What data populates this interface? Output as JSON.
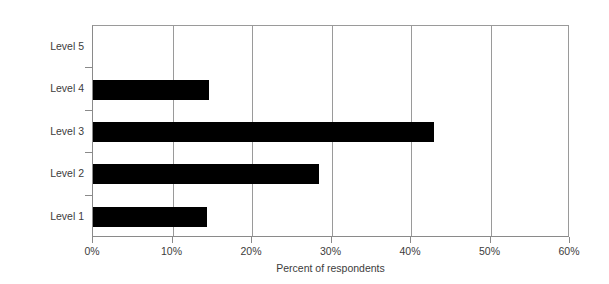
{
  "chart_data": {
    "type": "bar",
    "orientation": "horizontal",
    "title": "",
    "xlabel": "Percent of respondents",
    "ylabel": "",
    "categories": [
      "Level 1",
      "Level 2",
      "Level 3",
      "Level 4",
      "Level 5"
    ],
    "values": [
      14.4,
      28.6,
      43.1,
      14.6,
      0
    ],
    "xlim": [
      0,
      60
    ],
    "ylim": null,
    "xticks": [
      0,
      10,
      20,
      30,
      40,
      50,
      60
    ],
    "xtick_labels": [
      "0%",
      "10%",
      "20%",
      "30%",
      "40%",
      "50%",
      "60%"
    ],
    "grid": "vertical",
    "legend": null,
    "series": [
      {
        "name": "Percent of respondents",
        "color": "#000000",
        "points": [
          {
            "category": "Level 5",
            "value": 0
          },
          {
            "category": "Level 4",
            "value": 14.6
          },
          {
            "category": "Level 3",
            "value": 43.1
          },
          {
            "category": "Level 2",
            "value": 28.6
          },
          {
            "category": "Level 1",
            "value": 14.4
          }
        ]
      }
    ]
  },
  "axes": {
    "x_title": "Percent of respondents",
    "tick_labels": [
      "0%",
      "10%",
      "20%",
      "30%",
      "40%",
      "50%",
      "60%"
    ],
    "category_labels_top_to_bottom": [
      "Level 5",
      "Level 4",
      "Level 3",
      "Level 2",
      "Level 1"
    ]
  },
  "style": {
    "bar_color": "#000000",
    "grid_color": "#9a9a9a",
    "axis_color": "#8a8a8a",
    "text_color": "#3c3c3c",
    "background": "#ffffff"
  }
}
